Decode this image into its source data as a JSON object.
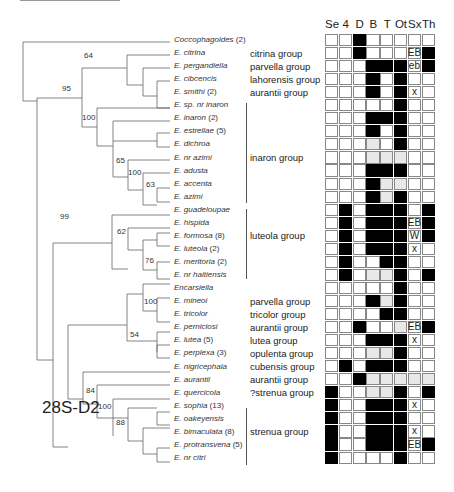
{
  "figure": {
    "marker_label": "28S-D2",
    "columns": [
      "Se",
      "4",
      "D",
      "B",
      "T",
      "Ot",
      "Sx",
      "Th"
    ],
    "legend": {
      "filled": "#000000",
      "polymorphic": "#e8e8e8",
      "empty": "#ffffff"
    }
  },
  "taxa": [
    {
      "name": "Coccophagoides",
      "count": "(2)",
      "group": "",
      "cells": [
        "",
        "",
        "b",
        "",
        "",
        "",
        "",
        ""
      ]
    },
    {
      "name": "E. citrina",
      "count": "",
      "group": "citrina group",
      "cells": [
        "",
        "",
        "b",
        "",
        "",
        "",
        "EB",
        "b"
      ]
    },
    {
      "name": "E. pergandiella",
      "count": "",
      "group": "parvella group",
      "cells": [
        "",
        "",
        "",
        "b",
        "b",
        "b",
        "eb",
        "b"
      ]
    },
    {
      "name": "E. cibcencis",
      "count": "",
      "group": "lahorensis group",
      "cells": [
        "",
        "",
        "",
        "b",
        "",
        "b",
        "",
        ""
      ]
    },
    {
      "name": "E. smithi",
      "count": "(2)",
      "group": "aurantii group",
      "cells": [
        "",
        "",
        "",
        "b",
        "",
        "b",
        "x",
        ""
      ]
    },
    {
      "name": "E. sp. nr inaron",
      "count": "",
      "group": "",
      "cells": [
        "",
        "",
        "",
        "",
        "",
        "b",
        "",
        ""
      ]
    },
    {
      "name": "E. inaron",
      "count": "(2)",
      "group": "",
      "cells": [
        "",
        "",
        "",
        "b",
        "b",
        "b",
        "",
        ""
      ]
    },
    {
      "name": "E. estrellae",
      "count": "(5)",
      "group": "",
      "cells": [
        "",
        "",
        "",
        "b",
        "",
        "b",
        "",
        ""
      ]
    },
    {
      "name": "E. dichroa",
      "count": "",
      "group": "",
      "cells": [
        "",
        "",
        "",
        "g",
        "",
        "b",
        "",
        ""
      ]
    },
    {
      "name": "E. nr azimi",
      "count": "",
      "group": "inaron group",
      "cells": [
        "",
        "",
        "",
        "g",
        "g",
        "g",
        "",
        ""
      ]
    },
    {
      "name": "E. adusta",
      "count": "",
      "group": "",
      "cells": [
        "",
        "",
        "",
        "b",
        "b",
        "b",
        "",
        ""
      ]
    },
    {
      "name": "E. accenta",
      "count": "",
      "group": "",
      "cells": [
        "",
        "",
        "",
        "b",
        "g",
        "g",
        "",
        ""
      ]
    },
    {
      "name": "E. azimi",
      "count": "",
      "group": "",
      "cells": [
        "",
        "",
        "",
        "b",
        "g",
        "b",
        "",
        ""
      ]
    },
    {
      "name": "E. guadeloupae",
      "count": "",
      "group": "",
      "cells": [
        "",
        "b",
        "",
        "b",
        "b",
        "b",
        "",
        "b"
      ]
    },
    {
      "name": "E. hispida",
      "count": "",
      "group": "",
      "cells": [
        "",
        "b",
        "",
        "b",
        "b",
        "b",
        "EB",
        "b"
      ]
    },
    {
      "name": "E. formosa",
      "count": "(8)",
      "group": "luteola group",
      "cells": [
        "",
        "b",
        "",
        "b",
        "b",
        "b",
        "W",
        "b"
      ]
    },
    {
      "name": "E. luteola",
      "count": "(2)",
      "group": "",
      "cells": [
        "",
        "b",
        "",
        "b",
        "b",
        "b",
        "x",
        ""
      ]
    },
    {
      "name": "E. meritoria",
      "count": "(2)",
      "group": "",
      "cells": [
        "",
        "b",
        "",
        "",
        "b",
        "b",
        "",
        ""
      ]
    },
    {
      "name": "E. nr haitiensis",
      "count": "",
      "group": "",
      "cells": [
        "",
        "b",
        "",
        "g",
        "g",
        "b",
        "",
        "b"
      ]
    },
    {
      "name": "Encarsiella",
      "count": "",
      "group": "",
      "cells": [
        "",
        "",
        "",
        "",
        "",
        "b",
        "",
        ""
      ]
    },
    {
      "name": "E. mineoi",
      "count": "",
      "group": "parvella group",
      "cells": [
        "",
        "",
        "",
        "b",
        "g",
        "b",
        "",
        ""
      ]
    },
    {
      "name": "E. tricolor",
      "count": "",
      "group": "tricolor group",
      "cells": [
        "",
        "",
        "",
        "",
        "b",
        "b",
        "",
        ""
      ]
    },
    {
      "name": "E. perniciosi",
      "count": "",
      "group": "aurantii group",
      "cells": [
        "",
        "",
        "b",
        "",
        "",
        "g",
        "EB",
        "b"
      ]
    },
    {
      "name": "E. lutea",
      "count": "(5)",
      "group": "lutea group",
      "cells": [
        "",
        "",
        "",
        "b",
        "b",
        "b",
        "x",
        ""
      ]
    },
    {
      "name": "E. perplexa",
      "count": "(3)",
      "group": "opulenta group",
      "cells": [
        "",
        "",
        "",
        "g",
        "g",
        "b",
        "",
        ""
      ]
    },
    {
      "name": "E. nigricephala",
      "count": "",
      "group": "cubensis group",
      "cells": [
        "",
        "b",
        "",
        "b",
        "b",
        "b",
        "",
        ""
      ]
    },
    {
      "name": "E. aurantii",
      "count": "",
      "group": "aurantii group",
      "cells": [
        "",
        "",
        "b",
        "g",
        "g",
        "g",
        "g",
        "g"
      ]
    },
    {
      "name": "E. quercicola",
      "count": "",
      "group": "?strenua group",
      "cells": [
        "b",
        "",
        "",
        "g",
        "g",
        "b",
        "",
        "b"
      ]
    },
    {
      "name": "E. sophia",
      "count": "(13)",
      "group": "",
      "cells": [
        "b",
        "",
        "",
        "b",
        "b",
        "b",
        "x",
        ""
      ]
    },
    {
      "name": "E. oakeyensis",
      "count": "",
      "group": "",
      "cells": [
        "b",
        "",
        "",
        "b",
        "b",
        "b",
        "",
        ""
      ]
    },
    {
      "name": "E. bimaculata",
      "count": "(8)",
      "group": "strenua group",
      "cells": [
        "b",
        "",
        "",
        "b",
        "b",
        "b",
        "x",
        ""
      ]
    },
    {
      "name": "E. protransvena",
      "count": "(5)",
      "group": "",
      "cells": [
        "b",
        "",
        "",
        "b",
        "b",
        "b",
        "EB",
        "b"
      ]
    },
    {
      "name": "E. nr citri",
      "count": "",
      "group": "",
      "cells": [
        "b",
        "",
        "",
        "",
        "",
        "b",
        "",
        ""
      ]
    }
  ],
  "support_values": [
    {
      "value": "64",
      "x": 84,
      "y": 61
    },
    {
      "value": "95",
      "x": 62,
      "y": 94
    },
    {
      "value": "100",
      "x": 82,
      "y": 123
    },
    {
      "value": "65",
      "x": 116,
      "y": 166
    },
    {
      "value": "100",
      "x": 128,
      "y": 178
    },
    {
      "value": "63",
      "x": 146,
      "y": 190
    },
    {
      "value": "99",
      "x": 60,
      "y": 222
    },
    {
      "value": "62",
      "x": 117,
      "y": 237
    },
    {
      "value": "76",
      "x": 145,
      "y": 266
    },
    {
      "value": "100",
      "x": 144,
      "y": 307
    },
    {
      "value": "54",
      "x": 130,
      "y": 340
    },
    {
      "value": "84",
      "x": 86,
      "y": 396
    },
    {
      "value": "100",
      "x": 98,
      "y": 412
    },
    {
      "value": "88",
      "x": 116,
      "y": 428
    }
  ]
}
